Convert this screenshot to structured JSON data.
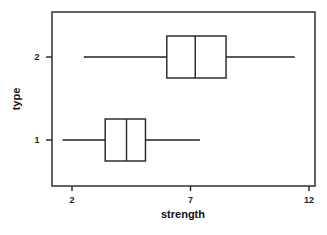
{
  "chart_data": {
    "type": "boxplot",
    "orientation": "horizontal",
    "title": "",
    "xlabel": "strength",
    "ylabel": "type",
    "xlim": [
      1.2,
      12.25
    ],
    "xticks": [
      2,
      7,
      12
    ],
    "xtick_labels": [
      "2",
      "7",
      "12"
    ],
    "categories": [
      "1",
      "2"
    ],
    "grid": false,
    "legend": null,
    "series": [
      {
        "name": "1",
        "whisker_low": 1.6,
        "q1": 3.4,
        "median": 4.3,
        "q3": 5.1,
        "whisker_high": 7.4
      },
      {
        "name": "2",
        "whisker_low": 2.5,
        "q1": 6.0,
        "median": 7.2,
        "q3": 8.5,
        "whisker_high": 11.4
      }
    ]
  },
  "colors": {
    "ink": "#222222",
    "background": "#ffffff"
  }
}
